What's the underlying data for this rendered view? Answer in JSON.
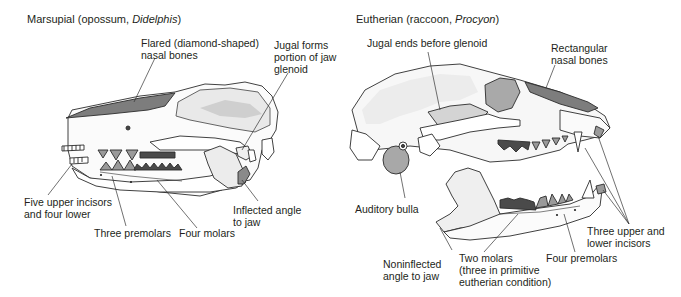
{
  "panels": [
    {
      "id": "marsupial",
      "title_prefix": "Marsupial (opossum, ",
      "title_italic": "Didelphis",
      "title_suffix": ")",
      "labels": [
        {
          "id": "nasal",
          "lines": [
            "Flared (diamond-shaped)",
            "nasal bones"
          ]
        },
        {
          "id": "jugal",
          "lines": [
            "Jugal forms",
            "portion of jaw",
            "glenoid"
          ]
        },
        {
          "id": "incisors",
          "lines": [
            "Five upper incisors",
            "and four lower"
          ]
        },
        {
          "id": "premolars",
          "lines": [
            "Three premolars"
          ]
        },
        {
          "id": "molars",
          "lines": [
            "Four molars"
          ]
        },
        {
          "id": "angle",
          "lines": [
            "Inflected angle",
            "to jaw"
          ]
        }
      ]
    },
    {
      "id": "eutherian",
      "title_prefix": "Eutherian (raccoon, ",
      "title_italic": "Procyon",
      "title_suffix": ")",
      "labels": [
        {
          "id": "jugal",
          "lines": [
            "Jugal ends before glenoid"
          ]
        },
        {
          "id": "nasal",
          "lines": [
            "Rectangular",
            "nasal bones"
          ]
        },
        {
          "id": "bulla",
          "lines": [
            "Auditory bulla"
          ]
        },
        {
          "id": "incisors",
          "lines": [
            "Three upper and",
            "lower incisors"
          ]
        },
        {
          "id": "premolars",
          "lines": [
            "Four premolars"
          ]
        },
        {
          "id": "molars",
          "lines": [
            "Two molars",
            "(three in primitive",
            "eutherian condition)"
          ]
        },
        {
          "id": "angle",
          "lines": [
            "Noninflected",
            "angle to jaw"
          ]
        }
      ]
    }
  ],
  "colors": {
    "nasal_shade": "#7d7d7d",
    "premolar_fill": "#9a9a9a",
    "molar_fill": "#4a4a4a",
    "bone_stroke": "#2b2b2b",
    "leader_line": "#333333",
    "text": "#231f20"
  }
}
